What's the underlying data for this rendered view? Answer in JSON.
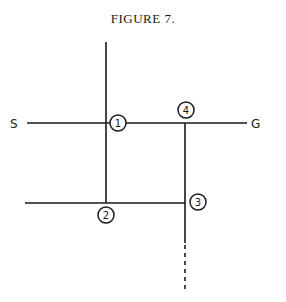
{
  "figure": {
    "title": "FIGURE 7."
  },
  "labels": {
    "start": "S",
    "goal": "G"
  },
  "nodes": [
    {
      "id": "1",
      "label": "1",
      "cx": 118,
      "cy": 123
    },
    {
      "id": "2",
      "label": "2",
      "cx": 106,
      "cy": 215
    },
    {
      "id": "3",
      "label": "3",
      "cx": 198,
      "cy": 202
    },
    {
      "id": "4",
      "label": "4",
      "cx": 186,
      "cy": 110
    }
  ],
  "colors": {
    "stroke": "#1a1a1a",
    "background": "#ffffff"
  }
}
